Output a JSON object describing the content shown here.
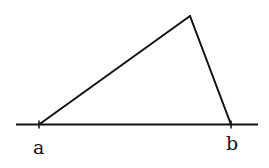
{
  "diagram": {
    "type": "geometry-triangle-on-line",
    "stroke_color": "#111111",
    "background": "#ffffff",
    "baseline": {
      "x1": 16,
      "y1": 124.5,
      "x2": 258,
      "y2": 124.5
    },
    "vertices": {
      "a": {
        "x": 39,
        "y": 124.5
      },
      "b": {
        "x": 231,
        "y": 124.5
      },
      "apex": {
        "x": 190,
        "y": 16
      }
    },
    "labels": [
      {
        "id": "a",
        "text": "a"
      },
      {
        "id": "b",
        "text": "b"
      }
    ]
  }
}
